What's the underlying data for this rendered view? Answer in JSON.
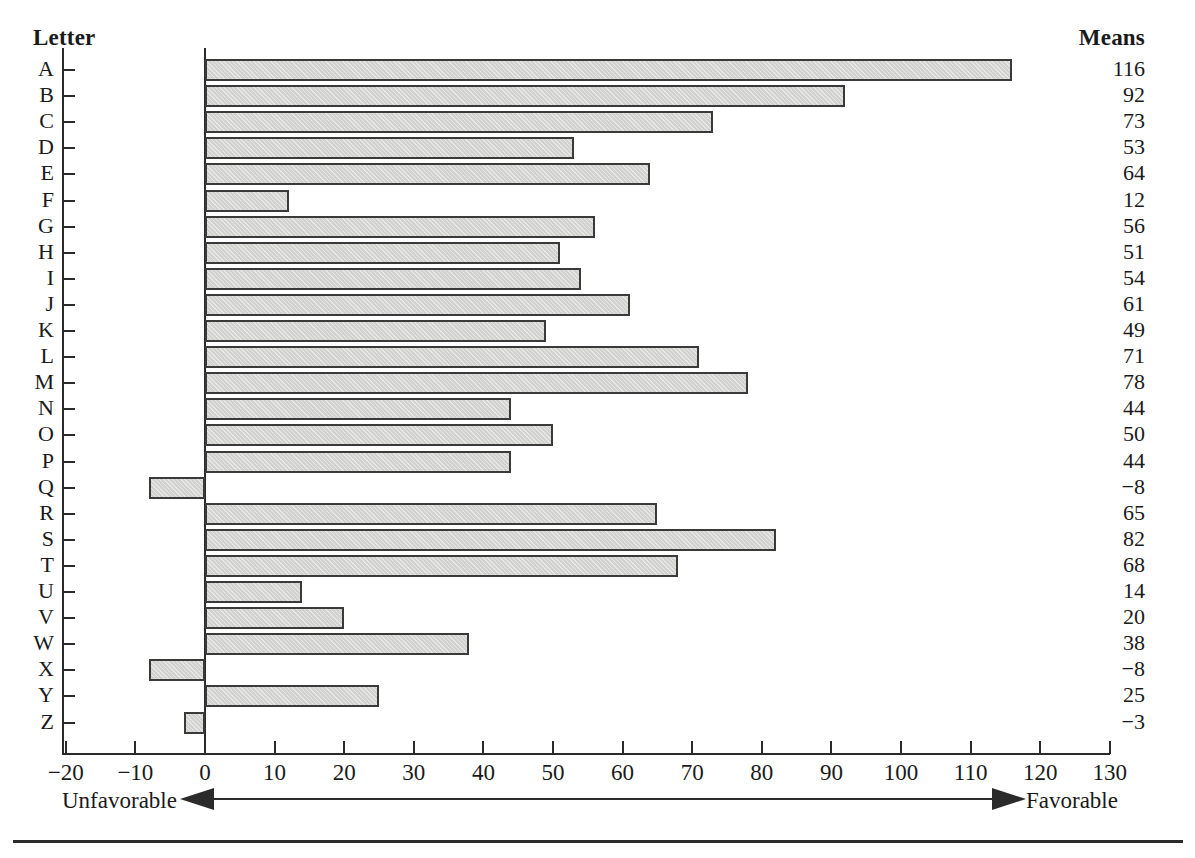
{
  "headers": {
    "letter": "Letter",
    "means": "Means"
  },
  "annotations": {
    "unfavorable": "Unfavorable",
    "favorable": "Favorable"
  },
  "colors": {
    "bar_fill": "#d2d2d0",
    "bar_border": "#3a3a3a",
    "axis": "#2b2b2b",
    "text": "#1a1a1a"
  },
  "chart_data": {
    "type": "bar",
    "orientation": "horizontal",
    "title": "",
    "subtitle": "",
    "xlabel": "",
    "ylabel": "Letter",
    "xlim": [
      -20,
      130
    ],
    "ylim": null,
    "grid": false,
    "legend": null,
    "value_column_label": "Means",
    "x_ticks": [
      -20,
      -10,
      0,
      10,
      20,
      30,
      40,
      50,
      60,
      70,
      80,
      90,
      100,
      110,
      120,
      130
    ],
    "x_tick_labels": [
      "−20",
      "−10",
      "0",
      "10",
      "20",
      "30",
      "40",
      "50",
      "60",
      "70",
      "80",
      "90",
      "100",
      "110",
      "120",
      "130"
    ],
    "categories": [
      "A",
      "B",
      "C",
      "D",
      "E",
      "F",
      "G",
      "H",
      "I",
      "J",
      "K",
      "L",
      "M",
      "N",
      "O",
      "P",
      "Q",
      "R",
      "S",
      "T",
      "U",
      "V",
      "W",
      "X",
      "Y",
      "Z"
    ],
    "values": [
      116,
      92,
      73,
      53,
      64,
      12,
      56,
      51,
      54,
      61,
      49,
      71,
      78,
      44,
      50,
      44,
      -8,
      65,
      82,
      68,
      14,
      20,
      38,
      -8,
      25,
      -3
    ],
    "value_labels": [
      "116",
      "92",
      "73",
      "53",
      "64",
      "12",
      "56",
      "51",
      "54",
      "61",
      "49",
      "71",
      "78",
      "44",
      "50",
      "44",
      "−8",
      "65",
      "82",
      "68",
      "14",
      "20",
      "38",
      "−8",
      "25",
      "−3"
    ],
    "annotations": [
      {
        "text": "Unfavorable",
        "direction": "left",
        "position": "below-axis-left"
      },
      {
        "text": "Favorable",
        "direction": "right",
        "position": "below-axis-right"
      }
    ]
  }
}
